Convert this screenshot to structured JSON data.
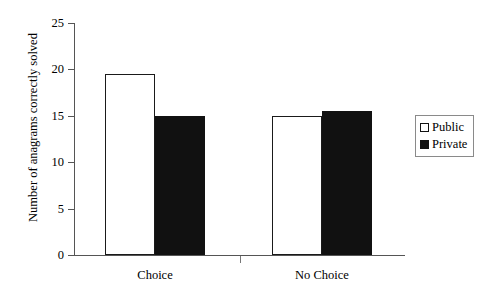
{
  "chart_data": {
    "type": "bar",
    "title": "",
    "subtitle": "",
    "xlabel": "",
    "ylabel": "Number of anagrams correctly solved",
    "categories": [
      "Choice",
      "No Choice"
    ],
    "series": [
      {
        "name": "Public",
        "values": [
          19.5,
          15.0
        ],
        "color": "#ffffff"
      },
      {
        "name": "Private",
        "values": [
          15.0,
          15.5
        ],
        "color": "#111111"
      }
    ],
    "ylim": [
      0,
      25
    ],
    "yticks": [
      0,
      5,
      10,
      15,
      20,
      25
    ],
    "ytick_labels": [
      "0",
      "5",
      "10",
      "15",
      "20",
      "25"
    ],
    "grid": false,
    "legend_position": "right",
    "legend_entries": [
      {
        "label": "Public",
        "swatch": "hollow"
      },
      {
        "label": "Private",
        "swatch": "filled"
      }
    ],
    "axis_color": "#555555",
    "bar_edge_color": "#1a1a1a"
  }
}
